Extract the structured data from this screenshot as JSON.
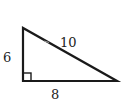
{
  "diagram": {
    "type": "right-triangle",
    "colors": {
      "stroke": "#1a1a1a",
      "text": "#222222",
      "background": "#ffffff"
    },
    "vertices": {
      "top_left": [
        23,
        28
      ],
      "bottom_left": [
        23,
        81
      ],
      "bottom_right": [
        117,
        81
      ]
    },
    "right_angle_marker": "bottom_left",
    "sides": {
      "vertical_leg": {
        "label": "6"
      },
      "horizontal_leg": {
        "label": "8"
      },
      "hypotenuse": {
        "label": "10"
      }
    }
  }
}
